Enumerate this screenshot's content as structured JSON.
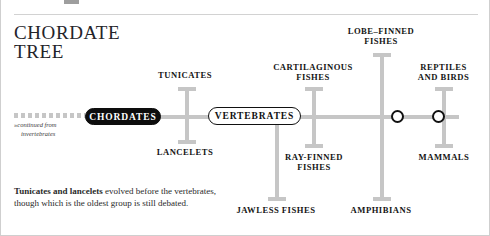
{
  "page": {
    "title_line1": "CHORDATE",
    "title_line2": "TREE",
    "title": "CHORDATE\nTREE"
  },
  "continuation": {
    "arrow": "»",
    "line1": "continued from",
    "line2": "invertebrates"
  },
  "nodes": {
    "chordates": "CHORDATES",
    "vertebrates": "VERTEBRATES"
  },
  "taxa": [
    {
      "id": "tunicates",
      "label": "TUNICATES"
    },
    {
      "id": "lancelets",
      "label": "LANCELETS"
    },
    {
      "id": "cartilaginous",
      "label": "CARTILAGINOUS\nFISHES"
    },
    {
      "id": "lobe-finned",
      "label": "LOBE–FINNED\nFISHES"
    },
    {
      "id": "reptiles",
      "label": "REPTILES\nAND BIRDS"
    },
    {
      "id": "ray-finned",
      "label": "RAY-FINNED\nFISHES"
    },
    {
      "id": "mammals",
      "label": "MAMMALS"
    },
    {
      "id": "jawless",
      "label": "JAWLESS FISHES"
    },
    {
      "id": "amphibians",
      "label": "AMPHIBIANS"
    }
  ],
  "caption": {
    "bold": "Tunicates and lancelets",
    "rest": " evolved before the vertebrates, though which is the oldest group is still debated."
  },
  "colors": {
    "branch": "#c6c6c6",
    "node_outline": "#111111",
    "pill_solid_bg": "#0d0d0d",
    "pill_solid_text": "#ffffff",
    "text": "#141414",
    "rule": "#d2d2d2",
    "page_border": "#cfcfcf"
  }
}
